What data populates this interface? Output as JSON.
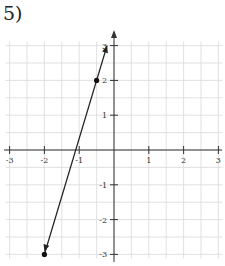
{
  "problem": {
    "number_label": "5)"
  },
  "colors": {
    "grid": "#d9d9d9",
    "axis": "#333333",
    "line": "#222222",
    "point": "#111111"
  },
  "chart_data": {
    "type": "line",
    "title": "",
    "xlabel": "",
    "ylabel": "",
    "xlim": [
      -3,
      3
    ],
    "ylim": [
      -3,
      3
    ],
    "grid": true,
    "grid_step": 0.5,
    "x_ticks": [
      -3,
      -2,
      -1,
      1,
      2,
      3
    ],
    "y_ticks": [
      -3,
      -2,
      -1,
      1,
      2,
      3
    ],
    "x_tick_labels": [
      "-3",
      "-2",
      "-1",
      "1",
      "2",
      "3"
    ],
    "y_tick_labels": [
      "-3",
      "-2",
      "-1",
      "1",
      "2",
      "3"
    ],
    "series": [
      {
        "name": "line",
        "points": [
          [
            -2,
            -3
          ],
          [
            -0.5,
            2
          ]
        ],
        "marked_points": [
          [
            -0.5,
            2
          ],
          [
            -2,
            -3
          ]
        ],
        "slope": 3.333,
        "arrows": "both",
        "extent": [
          [
            -2,
            -3
          ],
          [
            -0.2,
            3
          ]
        ]
      }
    ]
  }
}
